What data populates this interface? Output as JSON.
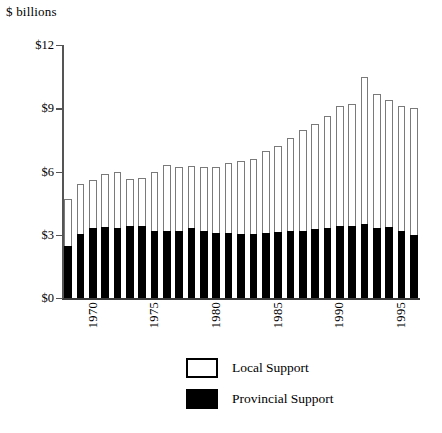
{
  "chart_data": {
    "type": "bar",
    "subtype": "stacked",
    "title": "",
    "ylabel": "$ billions",
    "xlabel": "",
    "ylim": [
      0,
      12
    ],
    "yticks": [
      0,
      3,
      6,
      9,
      12
    ],
    "ytick_labels": [
      "$0",
      "$3",
      "$6",
      "$9",
      "$12"
    ],
    "grid": false,
    "legend_position": "bottom-center",
    "categories": [
      1969,
      1970,
      1971,
      1972,
      1973,
      1974,
      1975,
      1976,
      1977,
      1978,
      1979,
      1980,
      1981,
      1982,
      1983,
      1984,
      1985,
      1986,
      1987,
      1988,
      1989,
      1990,
      1991,
      1992,
      1993,
      1994,
      1995,
      1996,
      1997
    ],
    "xtick_labels": [
      "1970",
      "1975",
      "1980",
      "1985",
      "1990",
      "1995"
    ],
    "xtick_categories": [
      1970,
      1975,
      1980,
      1985,
      1990,
      1995
    ],
    "series": [
      {
        "name": "Provincial Support",
        "color": "#000000",
        "values": [
          2.45,
          3.05,
          3.3,
          3.35,
          3.3,
          3.4,
          3.4,
          3.2,
          3.2,
          3.2,
          3.3,
          3.2,
          3.1,
          3.1,
          3.05,
          3.05,
          3.1,
          3.15,
          3.2,
          3.2,
          3.25,
          3.3,
          3.4,
          3.4,
          3.5,
          3.3,
          3.35,
          3.2,
          3.0
        ]
      },
      {
        "name": "Local Support",
        "color": "#ffffff",
        "values": [
          2.25,
          2.35,
          2.3,
          2.55,
          2.7,
          2.25,
          2.3,
          2.8,
          3.1,
          3.0,
          2.95,
          3.0,
          3.1,
          3.3,
          3.45,
          3.55,
          3.85,
          4.05,
          4.4,
          4.75,
          5.0,
          5.35,
          5.7,
          5.8,
          7.0,
          6.4,
          6.05,
          5.9,
          6.0
        ]
      }
    ],
    "totals": [
      4.7,
      5.4,
      5.6,
      5.9,
      6.0,
      5.65,
      5.7,
      6.0,
      6.3,
      6.2,
      6.25,
      6.2,
      6.2,
      6.4,
      6.5,
      6.6,
      6.95,
      7.2,
      7.6,
      7.95,
      8.25,
      8.65,
      9.1,
      9.2,
      10.5,
      9.7,
      9.4,
      9.1,
      9.0
    ]
  },
  "legend": {
    "items": [
      {
        "label": "Local Support",
        "swatch": "open"
      },
      {
        "label": "Provincial Support",
        "swatch": "filled"
      }
    ]
  }
}
